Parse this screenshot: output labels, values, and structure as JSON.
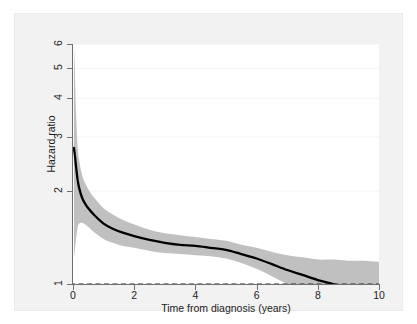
{
  "header": {
    "faint_top_text": ""
  },
  "chart_data": {
    "type": "line",
    "title": "",
    "xlabel": "Time from diagnosis (years)",
    "ylabel": "Hazard ratio",
    "xlim": [
      0,
      10
    ],
    "ylim": [
      1,
      6
    ],
    "yscale": "log",
    "grid": "horizontal-faint",
    "legend": "none",
    "xticks": [
      0,
      2,
      4,
      6,
      8,
      10
    ],
    "xtick_labels": [
      "0",
      "2",
      "4",
      "6",
      "8",
      "10"
    ],
    "yticks": [
      1,
      2,
      3,
      4,
      5,
      6
    ],
    "ytick_labels": [
      "1",
      "2",
      "3",
      "4",
      "5",
      "6"
    ],
    "reference_line": {
      "name": "null-hazard-ratio-line",
      "y": 1,
      "style": "dashed",
      "color": "#2b2b2b"
    },
    "colors": {
      "curve": "#000000",
      "band": "#c0c0c0",
      "axis": "#6f6f6f",
      "grid": "#f4f4f6",
      "plot_background": "#ffffff",
      "graph_background": "#f2f2f2"
    },
    "series": [
      {
        "name": "Hazard ratio",
        "x": [
          0.03,
          0.06,
          0.1,
          0.15,
          0.2,
          0.3,
          0.4,
          0.5,
          0.7,
          1.0,
          1.3,
          1.6,
          2.0,
          2.5,
          3.0,
          3.5,
          4.0,
          4.5,
          5.0,
          5.5,
          6.0,
          6.5,
          7.0,
          7.5,
          8.0,
          8.5,
          9.0,
          9.5,
          10.0
        ],
        "values": [
          2.76,
          2.62,
          2.4,
          2.18,
          2.05,
          1.9,
          1.82,
          1.76,
          1.67,
          1.57,
          1.51,
          1.47,
          1.43,
          1.39,
          1.36,
          1.34,
          1.33,
          1.31,
          1.29,
          1.25,
          1.21,
          1.16,
          1.11,
          1.07,
          1.03,
          1.0,
          0.97,
          0.94,
          0.92
        ]
      }
    ],
    "confidence_band": {
      "name": "95% confidence interval",
      "x": [
        0.03,
        0.06,
        0.1,
        0.15,
        0.2,
        0.3,
        0.4,
        0.5,
        0.7,
        1.0,
        1.3,
        1.6,
        2.0,
        2.5,
        3.0,
        3.5,
        4.0,
        4.5,
        5.0,
        5.5,
        6.0,
        6.5,
        7.0,
        7.5,
        8.0,
        8.5,
        9.0,
        9.5,
        10.0
      ],
      "upper": [
        6.0,
        5.0,
        3.6,
        2.8,
        2.52,
        2.25,
        2.12,
        2.03,
        1.9,
        1.76,
        1.68,
        1.62,
        1.56,
        1.5,
        1.46,
        1.44,
        1.42,
        1.4,
        1.38,
        1.34,
        1.31,
        1.27,
        1.24,
        1.22,
        1.2,
        1.2,
        1.19,
        1.19,
        1.18
      ],
      "lower": [
        1.22,
        1.28,
        1.4,
        1.52,
        1.57,
        1.58,
        1.56,
        1.53,
        1.47,
        1.4,
        1.36,
        1.33,
        1.31,
        1.28,
        1.26,
        1.25,
        1.24,
        1.23,
        1.21,
        1.17,
        1.12,
        1.06,
        1.0,
        0.95,
        0.89,
        0.86,
        0.83,
        0.8,
        0.78
      ]
    }
  }
}
